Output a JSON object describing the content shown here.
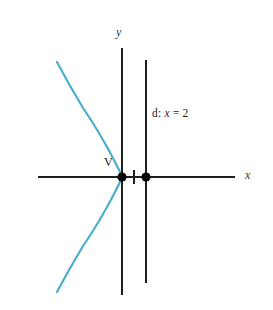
{
  "figure": {
    "width": 273,
    "height": 310,
    "background_color": "#ffffff"
  },
  "labels": {
    "y_axis": "y",
    "x_axis": "x",
    "vertex": "V",
    "directrix_prefix": "d: ",
    "directrix_variable": "x",
    "directrix_equation": " = 2"
  },
  "colors": {
    "curve": "#4aaecd",
    "axis": "#1f1f1f",
    "directrix": "#1f1f1f",
    "point": "#000000",
    "text": "#1a1a1a"
  },
  "chart_data": {
    "type": "line",
    "xlabel": "x",
    "ylabel": "y",
    "grid": false,
    "legend": null,
    "geometry": {
      "origin_px": [
        122,
        177
      ],
      "unit_px_per_x": 12,
      "vertex": {
        "label": "V",
        "x": 0,
        "y": 0,
        "px": [
          122,
          177
        ]
      },
      "focus": {
        "label": "",
        "x": 2,
        "y": 0,
        "px": [
          146,
          177
        ]
      },
      "tick_mark": {
        "x": 1,
        "px_x": 134
      },
      "directrix": {
        "label": "d: x = 2",
        "equation_x": 2,
        "px_x": 146,
        "px_y_top": 60,
        "px_y_bottom": 283
      },
      "x_axis": {
        "px_y": 177,
        "px_x_start": 38,
        "px_x_end": 235
      },
      "y_axis": {
        "px_x": 122,
        "px_y_top": 48,
        "px_y_bottom": 295
      }
    },
    "curve_points_px": [
      [
        57,
        62
      ],
      [
        63,
        73
      ],
      [
        69,
        84
      ],
      [
        76,
        96
      ],
      [
        83,
        108
      ],
      [
        91,
        120
      ],
      [
        99,
        133
      ],
      [
        107,
        147
      ],
      [
        114,
        160
      ],
      [
        119,
        170
      ],
      [
        122,
        177
      ],
      [
        119,
        184
      ],
      [
        114,
        194
      ],
      [
        107,
        207
      ],
      [
        99,
        221
      ],
      [
        91,
        234
      ],
      [
        83,
        246
      ],
      [
        76,
        258
      ],
      [
        69,
        270
      ],
      [
        63,
        281
      ],
      [
        57,
        292
      ]
    ]
  }
}
